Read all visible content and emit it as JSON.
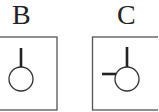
{
  "panels": [
    {
      "label": "B",
      "ticks": [
        "top"
      ]
    },
    {
      "label": "C",
      "ticks": [
        "top",
        "left"
      ]
    }
  ],
  "colors": {
    "stroke": "#333333",
    "background": "#ffffff"
  }
}
